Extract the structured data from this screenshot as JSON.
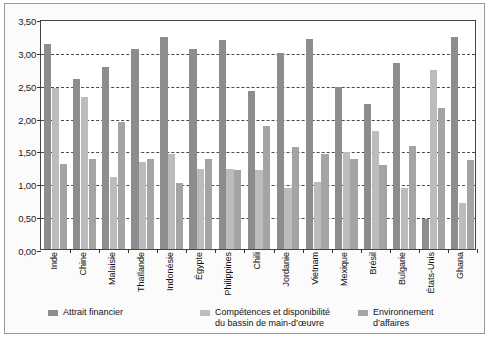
{
  "chart_data": {
    "type": "bar",
    "title": "",
    "subtitle": "",
    "xlabel": "",
    "ylabel": "",
    "ylim": [
      0,
      3.5
    ],
    "ytick_labels": [
      "0,00",
      "0,50",
      "1,00",
      "1,50",
      "2,00",
      "2,50",
      "3,00",
      "3,50"
    ],
    "ytick_values": [
      0,
      0.5,
      1.0,
      1.5,
      2.0,
      2.5,
      3.0,
      3.5
    ],
    "grid": "horizontal-dashed",
    "legend_position": "bottom",
    "categories": [
      "Inde",
      "Chine",
      "Malaisie",
      "Thaïlande",
      "Indonésie",
      "Égypte",
      "Philippines",
      "Chili",
      "Jordanie",
      "Vietnam",
      "Mexique",
      "Brésil",
      "Bulgarie",
      "États-Unis",
      "Ghana"
    ],
    "series": [
      {
        "name": "Attrait financier",
        "color": "#8d8d8d",
        "values": [
          3.12,
          2.58,
          2.77,
          3.05,
          3.22,
          3.05,
          3.18,
          2.4,
          2.98,
          3.2,
          2.47,
          2.2,
          2.83,
          0.45,
          3.23
        ]
      },
      {
        "name": "Compétences et disponibilité\ndu bassin de main-d’œuvre",
        "color": "#bcbcbc",
        "values": [
          2.45,
          2.32,
          1.1,
          1.33,
          1.45,
          1.22,
          1.22,
          1.2,
          0.93,
          1.02,
          1.47,
          1.8,
          0.93,
          2.72,
          0.7
        ]
      },
      {
        "name": "Environnement d’affaires",
        "color": "#a4a4a4",
        "values": [
          1.3,
          1.37,
          1.93,
          1.37,
          1.0,
          1.37,
          1.2,
          1.87,
          1.55,
          1.45,
          1.37,
          1.28,
          1.57,
          2.15,
          1.35
        ]
      }
    ]
  },
  "legend": {
    "items": [
      {
        "label": "Attrait financier",
        "swatch": "s0"
      },
      {
        "label": "Compétences et disponibilité\ndu bassin de main-d’œuvre",
        "swatch": "s1"
      },
      {
        "label": "Environnement d’affaires",
        "swatch": "s2"
      }
    ]
  }
}
